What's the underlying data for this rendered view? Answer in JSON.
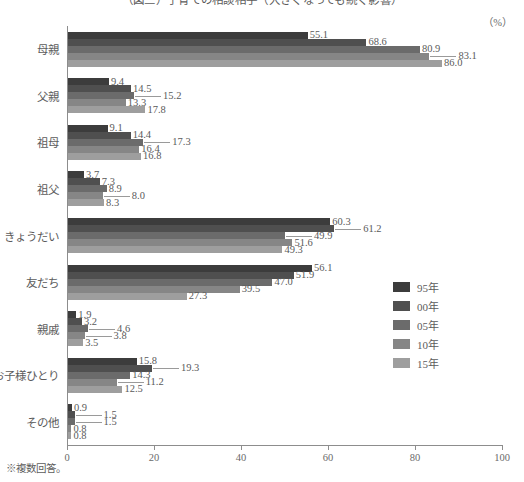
{
  "title": "（図三）子育ての相談相手（大きくなっても続く影響）",
  "unit_label": "（%）",
  "footnote": "※複数回答。",
  "legend": {
    "position": "right-middle",
    "items": [
      {
        "label": "95年",
        "color": "#3c3c3c"
      },
      {
        "label": "00年",
        "color": "#4f4f4f"
      },
      {
        "label": "05年",
        "color": "#6b6b6b"
      },
      {
        "label": "10年",
        "color": "#868686"
      },
      {
        "label": "15年",
        "color": "#9e9e9e"
      }
    ]
  },
  "axis": {
    "ticks": [
      "0",
      "20",
      "40",
      "60",
      "80",
      "100"
    ],
    "min": 0,
    "max": 100
  },
  "chart_data": {
    "type": "bar",
    "orientation": "horizontal",
    "title": "（図三）子育ての相談相手（大きくなっても続く影響）",
    "xlabel": "（%）",
    "ylabel": "",
    "xlim": [
      0,
      100
    ],
    "grid": false,
    "legend_position": "right",
    "categories": [
      "母親",
      "父親",
      "祖母",
      "祖父",
      "きょうだい",
      "友だち",
      "親戚",
      "お子様ひとり",
      "その他"
    ],
    "series": [
      {
        "name": "95年",
        "color": "#3c3c3c",
        "values": [
          55.1,
          9.4,
          9.1,
          3.7,
          60.3,
          56.1,
          1.9,
          15.8,
          0.9
        ]
      },
      {
        "name": "00年",
        "color": "#4f4f4f",
        "values": [
          68.6,
          14.5,
          14.4,
          7.3,
          61.2,
          51.9,
          3.2,
          19.3,
          1.5
        ]
      },
      {
        "name": "05年",
        "color": "#6b6b6b",
        "values": [
          80.9,
          15.2,
          17.3,
          8.9,
          49.9,
          47.0,
          4.6,
          14.3,
          1.5
        ]
      },
      {
        "name": "10年",
        "color": "#868686",
        "values": [
          83.1,
          13.3,
          16.4,
          8.0,
          51.6,
          39.5,
          3.8,
          11.2,
          0.8
        ]
      },
      {
        "name": "15年",
        "color": "#9e9e9e",
        "values": [
          86.0,
          17.8,
          16.8,
          8.3,
          49.3,
          27.3,
          3.5,
          12.5,
          0.8
        ]
      }
    ],
    "value_labels": [
      [
        "55.1",
        "68.6",
        "80.9",
        "83.1",
        "86.0"
      ],
      [
        "9.4",
        "14.5",
        "15.2",
        "13.3",
        "17.8"
      ],
      [
        "9.1",
        "14.4",
        "17.3",
        "16.4",
        "16.8"
      ],
      [
        "3.7",
        "7.3",
        "8.9",
        "8.0",
        "8.3"
      ],
      [
        "60.3",
        "61.2",
        "49.9",
        "51.6",
        "49.3"
      ],
      [
        "56.1",
        "51.9",
        "47.0",
        "39.5",
        "27.3"
      ],
      [
        "1.9",
        "3.2",
        "4.6",
        "3.8",
        "3.5"
      ],
      [
        "15.8",
        "19.3",
        "14.3",
        "11.2",
        "12.5"
      ],
      [
        "0.9",
        "1.5",
        "1.5",
        "0.8",
        "0.8"
      ]
    ]
  }
}
